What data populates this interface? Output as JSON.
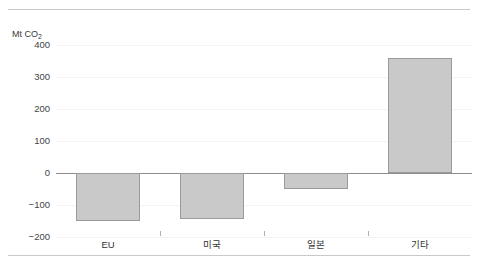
{
  "chart_data": {
    "type": "bar",
    "title": "",
    "subtitle": "",
    "xlabel": "",
    "ylabel": "Mt CO",
    "ylabel_sub": "2",
    "ylabel_full": "Mt CO₂",
    "categories": [
      "EU",
      "미국",
      "일본",
      "기타"
    ],
    "values": [
      -150,
      -145,
      -50,
      360
    ],
    "ylim": [
      -200,
      400
    ],
    "yticks": [
      400,
      300,
      200,
      100,
      0,
      -100,
      -200
    ],
    "ytick_labels": [
      "400",
      "300",
      "200",
      "100",
      "0",
      "−100",
      "−200"
    ],
    "grid": true,
    "legend": false,
    "legend_position": "none",
    "zero_line": 0,
    "orientation": "vertical",
    "series": [
      {
        "name": "",
        "values": [
          -150,
          -145,
          -50,
          360
        ]
      }
    ]
  },
  "style": {
    "bar_fill": "#c9c9c9",
    "bar_stroke": "#9a9a9a",
    "grid_color": "#f4f4f4",
    "zero_line_color": "#8d8d8d",
    "rule_color": "#c9c9c9",
    "text_color": "#333333",
    "background": "#ffffff"
  }
}
